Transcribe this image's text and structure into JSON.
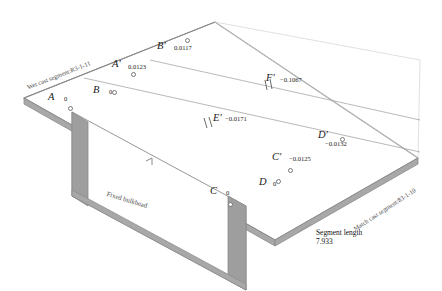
{
  "figure": {
    "type": "isometric-engineering-diagram",
    "background_color": "#ffffff",
    "line_color": "#8a8a8a",
    "fill_color": "#a8a8a8",
    "text_color": "#1a1a1a"
  },
  "annotations": {
    "wet_cast_label": "Wet cast segment:R3-1-11",
    "match_cast_label": "Match cast segment:83-1-10",
    "bulkhead_label": "Fixed bulkhead",
    "segment_length_label": "Segment length",
    "segment_length_value": "7.933"
  },
  "points": [
    {
      "id": "A",
      "name": "A",
      "value": "0",
      "nx": 48,
      "ny": 92,
      "vx": 64,
      "vy": 96,
      "mx": 68,
      "my": 106
    },
    {
      "id": "B",
      "name": "B",
      "value": "0",
      "nx": 93,
      "ny": 85,
      "vx": 109,
      "vy": 89,
      "mx": 112,
      "my": 90
    },
    {
      "id": "C",
      "name": "C",
      "value": "0",
      "nx": 210,
      "ny": 186,
      "vx": 226,
      "vy": 190,
      "mx": 228,
      "my": 202
    },
    {
      "id": "D",
      "name": "D",
      "value": "0",
      "nx": 259,
      "ny": 177,
      "vx": 273,
      "vy": 181,
      "mx": 276,
      "my": 179
    },
    {
      "id": "Ap",
      "name": "A′",
      "value": "0.0123",
      "nx": 112,
      "ny": 59,
      "vx": 128,
      "vy": 64,
      "mx": 131,
      "my": 72
    },
    {
      "id": "Bp",
      "name": "B′",
      "value": "0.0117",
      "nx": 157,
      "ny": 41,
      "vx": 174,
      "vy": 45,
      "mx": 185,
      "my": 38
    },
    {
      "id": "Cp",
      "name": "C′",
      "value": "−0.0125",
      "nx": 272,
      "ny": 152,
      "vx": 289,
      "vy": 156,
      "mx": 288,
      "my": 168
    },
    {
      "id": "Dp",
      "name": "D′",
      "value": "−0.0132",
      "nx": 318,
      "ny": 130,
      "vx": 325,
      "vy": 141,
      "mx": 340,
      "my": 137
    },
    {
      "id": "Ep",
      "name": "E′",
      "value": "−0.0171",
      "nx": 213,
      "ny": 113,
      "vx": 225,
      "vy": 116,
      "mx": null,
      "my": null
    },
    {
      "id": "Fp",
      "name": "F′",
      "value": "−0.1067",
      "nx": 266,
      "ny": 73,
      "vx": 280,
      "vy": 77,
      "mx": null,
      "my": null
    }
  ]
}
